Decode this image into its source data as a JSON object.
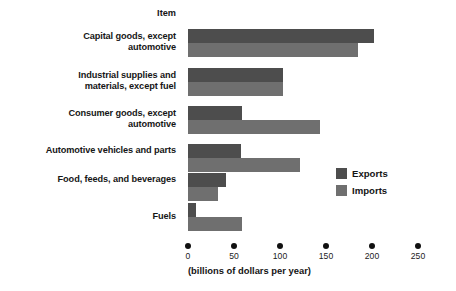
{
  "chart_data": {
    "type": "bar",
    "orientation": "horizontal",
    "title": "",
    "header_label": "Item",
    "categories": [
      "Capital goods, except automotive",
      "Industrial supplies and materials, except fuel",
      "Consumer goods, except automotive",
      "Automotive vehicles and parts",
      "Food, feeds, and beverages",
      "Fuels"
    ],
    "category_lines": [
      [
        "Capital goods, except",
        "automotive"
      ],
      [
        "Industrial supplies and",
        "materials, except fuel"
      ],
      [
        "Consumer goods, except",
        "automotive"
      ],
      [
        "Automotive vehicles and parts"
      ],
      [
        "Food, feeds, and beverages"
      ],
      [
        "Fuels"
      ]
    ],
    "series": [
      {
        "name": "Exports",
        "color": "#4d4d4d",
        "values": [
          202,
          103,
          59,
          58,
          41,
          9
        ]
      },
      {
        "name": "Imports",
        "color": "#6f6f6f",
        "values": [
          185,
          103,
          143,
          122,
          33,
          59
        ]
      }
    ],
    "xlabel": "(billions of dollars per year)",
    "ylabel": "",
    "xlim": [
      0,
      250
    ],
    "xticks": [
      0,
      50,
      100,
      150,
      200,
      250
    ],
    "xtick_labels": [
      "0",
      "50",
      "100",
      "150",
      "200",
      "250"
    ],
    "grid": false,
    "legend_position": "middle-right",
    "legend_entries": [
      "Exports",
      "Imports"
    ]
  }
}
